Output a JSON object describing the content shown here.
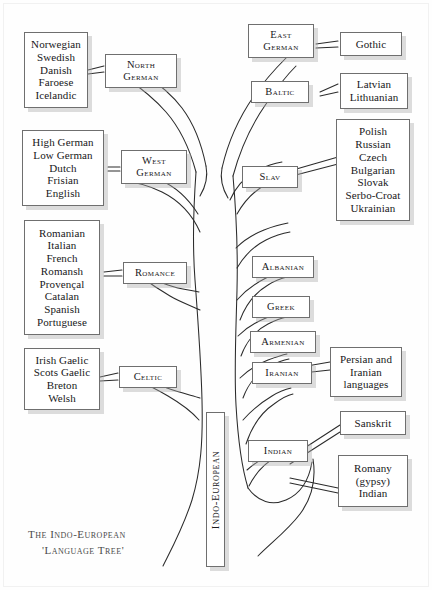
{
  "title": "The Indo-European 'Language Tree'",
  "caption": {
    "line1": "The Indo-European",
    "line2": "'Language Tree'"
  },
  "trunk": {
    "label": "Indo-European"
  },
  "colors": {
    "ink": "#18181a",
    "box_border": "#6f6f6f",
    "box_shadow": "#aaaaaa",
    "branch_line": "#2b2b2b",
    "page": "#ffffff",
    "caption": "#4a4a4a"
  },
  "nodes": [
    {
      "id": "north-german",
      "label_lines": [
        "North",
        "German"
      ]
    },
    {
      "id": "west-german",
      "label_lines": [
        "West",
        "German"
      ]
    },
    {
      "id": "romance",
      "label_lines": [
        "Romance"
      ]
    },
    {
      "id": "celtic",
      "label_lines": [
        "Celtic"
      ]
    },
    {
      "id": "east-german",
      "label_lines": [
        "East",
        "German"
      ]
    },
    {
      "id": "baltic",
      "label_lines": [
        "Baltic"
      ]
    },
    {
      "id": "slav",
      "label_lines": [
        "Slav"
      ]
    },
    {
      "id": "albanian",
      "label_lines": [
        "Albanian"
      ]
    },
    {
      "id": "greek",
      "label_lines": [
        "Greek"
      ]
    },
    {
      "id": "armenian",
      "label_lines": [
        "Armenian"
      ]
    },
    {
      "id": "iranian",
      "label_lines": [
        "Iranian"
      ]
    },
    {
      "id": "indian",
      "label_lines": [
        "Indian"
      ]
    }
  ],
  "leaves": [
    {
      "id": "north-german-languages",
      "parent": "north-german",
      "languages": [
        "Norwegian",
        "Swedish",
        "Danish",
        "Faroese",
        "Icelandic"
      ]
    },
    {
      "id": "west-german-languages",
      "parent": "west-german",
      "languages": [
        "High German",
        "Low German",
        "Dutch",
        "Frisian",
        "English"
      ]
    },
    {
      "id": "romance-languages",
      "parent": "romance",
      "languages": [
        "Romanian",
        "Italian",
        "French",
        "Romansh",
        "Provençal",
        "Catalan",
        "Spanish",
        "Portuguese"
      ]
    },
    {
      "id": "celtic-languages",
      "parent": "celtic",
      "languages": [
        "Irish Gaelic",
        "Scots Gaelic",
        "Breton",
        "Welsh"
      ]
    },
    {
      "id": "east-german-languages",
      "parent": "east-german",
      "languages": [
        "Gothic"
      ]
    },
    {
      "id": "baltic-languages",
      "parent": "baltic",
      "languages": [
        "Latvian",
        "Lithuanian"
      ]
    },
    {
      "id": "slav-languages",
      "parent": "slav",
      "languages": [
        "Polish",
        "Russian",
        "Czech",
        "Bulgarian",
        "Slovak",
        "Serbo-Croat",
        "Ukrainian"
      ]
    },
    {
      "id": "iranian-languages",
      "parent": "iranian",
      "languages": [
        "Persian and",
        "Iranian",
        "languages"
      ]
    },
    {
      "id": "indian-sanskrit",
      "parent": "indian",
      "languages": [
        "Sanskrit"
      ]
    },
    {
      "id": "indian-romany",
      "parent": "indian",
      "languages": [
        "Romany",
        "(gypsy)",
        "Indian"
      ]
    }
  ]
}
